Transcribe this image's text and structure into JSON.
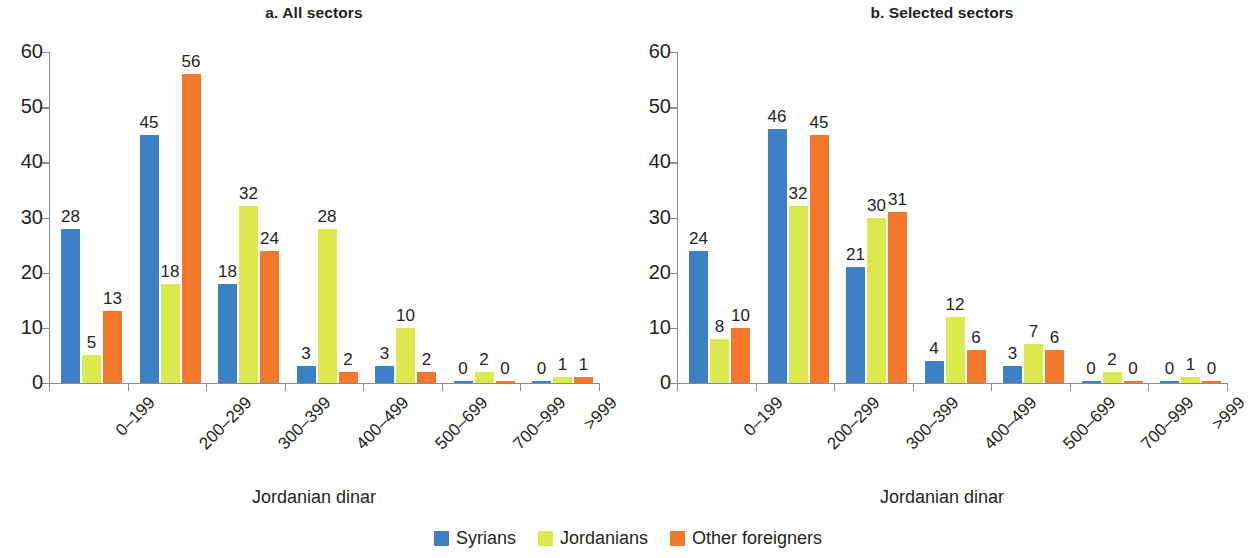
{
  "figure": {
    "xlabel": "Jordanian dinar"
  },
  "legend": {
    "items": [
      {
        "label": "Syrians",
        "color": "#3d80c5"
      },
      {
        "label": "Jordanians",
        "color": "#dde84f"
      },
      {
        "label": "Other foreigners",
        "color": "#f4782b"
      }
    ]
  },
  "yticks": [
    "0",
    "10",
    "20",
    "30",
    "40",
    "50",
    "60"
  ],
  "panels": [
    {
      "title": "a. All sectors",
      "xlabel": "Jordanian dinar"
    },
    {
      "title": "b. Selected sectors",
      "xlabel": "Jordanian dinar"
    }
  ],
  "chart_data": [
    {
      "type": "bar",
      "title": "a. All sectors",
      "xlabel": "Jordanian dinar",
      "ylabel": "",
      "ylim": [
        0,
        60
      ],
      "yticks": [
        0,
        10,
        20,
        30,
        40,
        50,
        60
      ],
      "grid": false,
      "legend_position": "bottom-center",
      "categories": [
        "0–199",
        "200–299",
        "300–399",
        "400–499",
        "500–699",
        "700–999",
        ">999"
      ],
      "series": [
        {
          "name": "Syrians",
          "color": "#3d80c5",
          "values": [
            28,
            45,
            18,
            3,
            3,
            0,
            0
          ]
        },
        {
          "name": "Jordanians",
          "color": "#dde84f",
          "values": [
            5,
            18,
            32,
            28,
            10,
            2,
            1
          ]
        },
        {
          "name": "Other foreigners",
          "color": "#f4782b",
          "values": [
            13,
            56,
            24,
            2,
            2,
            0,
            1
          ]
        }
      ]
    },
    {
      "type": "bar",
      "title": "b. Selected sectors",
      "xlabel": "Jordanian dinar",
      "ylabel": "",
      "ylim": [
        0,
        60
      ],
      "yticks": [
        0,
        10,
        20,
        30,
        40,
        50,
        60
      ],
      "grid": false,
      "legend_position": "bottom-center",
      "categories": [
        "0–199",
        "200–299",
        "300–399",
        "400–499",
        "500–699",
        "700–999",
        ">999"
      ],
      "series": [
        {
          "name": "Syrians",
          "color": "#3d80c5",
          "values": [
            24,
            46,
            21,
            4,
            3,
            0,
            0
          ]
        },
        {
          "name": "Jordanians",
          "color": "#dde84f",
          "values": [
            8,
            32,
            30,
            12,
            7,
            2,
            1
          ]
        },
        {
          "name": "Other foreigners",
          "color": "#f4782b",
          "values": [
            10,
            45,
            31,
            6,
            6,
            0,
            0
          ]
        }
      ]
    }
  ]
}
